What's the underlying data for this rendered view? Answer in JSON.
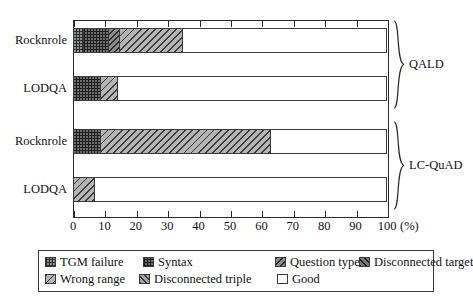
{
  "chart_data": {
    "type": "bar",
    "orientation": "horizontal",
    "stacked": true,
    "title": "",
    "xlabel": "(%)",
    "ylabel": "",
    "xlim": [
      0,
      100
    ],
    "grid": false,
    "legend_position": "bottom",
    "xticks": [
      "0",
      "10",
      "20",
      "30",
      "40",
      "50",
      "60",
      "70",
      "80",
      "90",
      "100"
    ],
    "xtick_values": [
      0,
      10,
      20,
      30,
      40,
      50,
      60,
      70,
      80,
      90,
      100
    ],
    "unit_label": "(%)",
    "series": [
      {
        "name": "TGM failure",
        "key": "tgm",
        "pattern": "p-tgm",
        "values": [
          3.5,
          0.0,
          0.0,
          0.0
        ]
      },
      {
        "name": "Syntax",
        "key": "syntax",
        "pattern": "p-syntax",
        "values": [
          8.0,
          8.8,
          9.0,
          0.0
        ]
      },
      {
        "name": "Question type",
        "key": "qtype",
        "pattern": "p-qtype",
        "values": [
          3.5,
          0.0,
          0.0,
          0.0
        ]
      },
      {
        "name": "Disconnected target",
        "key": "dtarget",
        "pattern": "p-dtarget",
        "values": [
          0.0,
          0.0,
          0.0,
          0.0
        ]
      },
      {
        "name": "Wrong range",
        "key": "wrange",
        "pattern": "p-wrange",
        "values": [
          20.0,
          5.5,
          54.0,
          7.0
        ]
      },
      {
        "name": "Disconnected triple",
        "key": "dtriple",
        "pattern": "p-dtriple",
        "values": [
          0.0,
          0.0,
          0.0,
          0.0
        ]
      },
      {
        "name": "Good",
        "key": "good",
        "pattern": "p-good",
        "values": [
          65.0,
          85.7,
          37.0,
          93.0
        ]
      }
    ],
    "categories": [
      {
        "label": "Rocknrole",
        "group": "QALD"
      },
      {
        "label": "LODQA",
        "group": "QALD"
      },
      {
        "label": "Rocknrole",
        "group": "LC-QuAD"
      },
      {
        "label": "LODQA",
        "group": "LC-QuAD"
      }
    ],
    "groups": [
      {
        "label": "QALD",
        "categories": [
          0,
          1
        ]
      },
      {
        "label": "LC-QuAD",
        "categories": [
          2,
          3
        ]
      }
    ]
  },
  "legend": {
    "rows": [
      [
        {
          "label": "TGM failure",
          "pattern": "p-tgm"
        },
        {
          "label": "Syntax",
          "pattern": "p-syntax"
        },
        {
          "label": "Question type",
          "pattern": "p-qtype"
        },
        {
          "label": "Disconnected target",
          "pattern": "p-dtarget"
        }
      ],
      [
        {
          "label": "Wrong range",
          "pattern": "p-wrange"
        },
        {
          "label": "Disconnected triple",
          "pattern": "p-dtriple"
        },
        {
          "label": "Good",
          "pattern": "p-good"
        }
      ]
    ]
  },
  "colors": {
    "axis": "#2b2b2b",
    "text": "#111111",
    "background": "#ffffff"
  }
}
